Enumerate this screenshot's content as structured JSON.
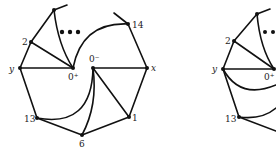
{
  "figure": {
    "left": {
      "labels": {
        "y": "y",
        "x": "x",
        "zero_plus": "0⁺",
        "zero_minus": "0⁻",
        "two": "2",
        "thirteen": "13",
        "six": "6",
        "one": "1",
        "fourteen": "14"
      },
      "ellipsis": "•••"
    },
    "right": {
      "labels": {
        "y": "y",
        "zero_plus": "0⁺",
        "two": "2",
        "thirteen": "13"
      },
      "ellipsis": "••"
    }
  }
}
